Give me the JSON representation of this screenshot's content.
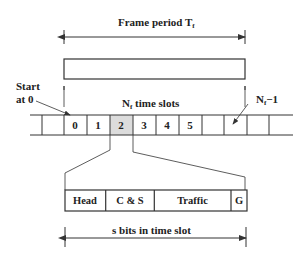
{
  "frame": {
    "title": "Frame period T",
    "title_sub": "f"
  },
  "start_label": {
    "line1": "Start",
    "line2": "at 0"
  },
  "slots_label": {
    "prefix": "N",
    "sub": "f",
    "suffix": " time slots"
  },
  "last_slot_label": {
    "prefix": "N",
    "sub": "f",
    "suffix": "−1"
  },
  "slots": [
    "",
    "0",
    "1",
    "2",
    "3",
    "4",
    "5",
    "",
    "",
    "",
    ""
  ],
  "highlighted_slot": "2",
  "slot_fields": [
    {
      "label": "Head"
    },
    {
      "label": "C & S"
    },
    {
      "label": "Traffic"
    },
    {
      "label": "G"
    }
  ],
  "slot_bits_label": "s bits in time slot",
  "colors": {
    "line": "#333333",
    "highlight": "#dcdcdc"
  }
}
